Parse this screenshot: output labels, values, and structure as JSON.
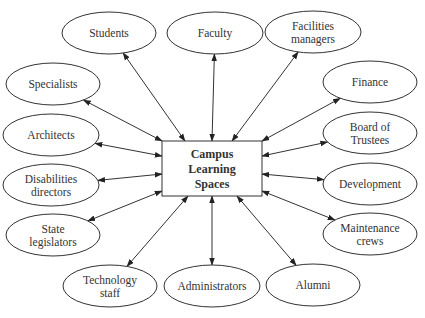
{
  "diagram": {
    "center": {
      "lines": [
        "Campus",
        "Learning",
        "Spaces"
      ],
      "box": {
        "x": 162,
        "y": 141,
        "w": 100,
        "h": 55
      }
    },
    "colors": {
      "stroke": "#333333",
      "text": "#333333",
      "background": "#ffffff"
    },
    "nodes": [
      {
        "id": "students",
        "lines": [
          "Students"
        ],
        "cx": 109,
        "cy": 33,
        "rx": 47,
        "ry": 21,
        "ax": 185,
        "ay": 141
      },
      {
        "id": "faculty",
        "lines": [
          "Faculty"
        ],
        "cx": 215,
        "cy": 33,
        "rx": 48,
        "ry": 21,
        "ax": 212,
        "ay": 141
      },
      {
        "id": "facilities-managers",
        "lines": [
          "Facilities",
          "managers"
        ],
        "cx": 313,
        "cy": 32,
        "rx": 48,
        "ry": 21,
        "ax": 232,
        "ay": 141
      },
      {
        "id": "specialists",
        "lines": [
          "Specialists"
        ],
        "cx": 53,
        "cy": 84,
        "rx": 47,
        "ry": 21,
        "ax": 162,
        "ay": 141
      },
      {
        "id": "finance",
        "lines": [
          "Finance"
        ],
        "cx": 370,
        "cy": 82,
        "rx": 47,
        "ry": 21,
        "ax": 262,
        "ay": 141
      },
      {
        "id": "architects",
        "lines": [
          "Architects"
        ],
        "cx": 51,
        "cy": 135,
        "rx": 48,
        "ry": 21,
        "ax": 162,
        "ay": 156
      },
      {
        "id": "board-of-trustees",
        "lines": [
          "Board of",
          "Trustees"
        ],
        "cx": 370,
        "cy": 133,
        "rx": 47,
        "ry": 21,
        "ax": 262,
        "ay": 156
      },
      {
        "id": "disabilities-directors",
        "lines": [
          "Disabilities",
          "directors"
        ],
        "cx": 51,
        "cy": 185,
        "rx": 48,
        "ry": 21,
        "ax": 162,
        "ay": 174
      },
      {
        "id": "development",
        "lines": [
          "Development"
        ],
        "cx": 370,
        "cy": 184,
        "rx": 47,
        "ry": 21,
        "ax": 262,
        "ay": 174
      },
      {
        "id": "state-legislators",
        "lines": [
          "State",
          "legislators"
        ],
        "cx": 53,
        "cy": 235,
        "rx": 47,
        "ry": 21,
        "ax": 162,
        "ay": 191
      },
      {
        "id": "maintenance-crews",
        "lines": [
          "Maintenance",
          "crews"
        ],
        "cx": 370,
        "cy": 234,
        "rx": 47,
        "ry": 21,
        "ax": 262,
        "ay": 191
      },
      {
        "id": "technology-staff",
        "lines": [
          "Technology",
          "staff"
        ],
        "cx": 110,
        "cy": 286,
        "rx": 47,
        "ry": 21,
        "ax": 188,
        "ay": 196
      },
      {
        "id": "administrators",
        "lines": [
          "Administrators"
        ],
        "cx": 212,
        "cy": 286,
        "rx": 48,
        "ry": 21,
        "ax": 212,
        "ay": 196
      },
      {
        "id": "alumni",
        "lines": [
          "Alumni"
        ],
        "cx": 313,
        "cy": 285,
        "rx": 47,
        "ry": 21,
        "ax": 237,
        "ay": 196
      }
    ],
    "edges_bidirectional": true
  }
}
